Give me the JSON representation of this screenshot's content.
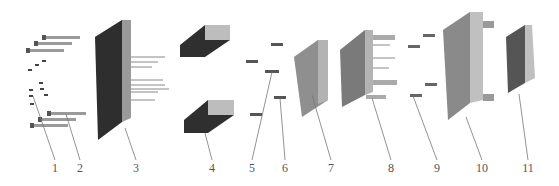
{
  "diagram": {
    "type": "exploded-view assembly",
    "background": "#ffffff",
    "colors": {
      "dark_plate": "#2e2e2e",
      "plate_face": "#8c8c8c",
      "plate_edge": "#b9b9b9",
      "plate_top": "#d0d0d0",
      "leader": "#777777",
      "label": "#555555"
    },
    "parts": [
      {
        "id": "1",
        "label": "1",
        "x": 55,
        "name": "small screws"
      },
      {
        "id": "2",
        "label": "2",
        "x": 80,
        "name": "long socket head bolts"
      },
      {
        "id": "3",
        "label": "3",
        "x": 136,
        "name": "dark plate with pins"
      },
      {
        "id": "4",
        "label": "4",
        "x": 212,
        "name": "spacer blocks"
      },
      {
        "id": "5",
        "label": "5",
        "x": 252,
        "name": "screws"
      },
      {
        "id": "6",
        "label": "6",
        "x": 285,
        "name": "screw"
      },
      {
        "id": "7",
        "label": "7",
        "x": 331,
        "name": "plain plate"
      },
      {
        "id": "8",
        "label": "8",
        "x": 391,
        "name": "plate with guide posts"
      },
      {
        "id": "9",
        "label": "9",
        "x": 437,
        "name": "screws"
      },
      {
        "id": "10",
        "label": "10",
        "x": 482,
        "name": "large plate with bushings"
      },
      {
        "id": "11",
        "label": "11",
        "x": 528,
        "name": "insert plate"
      }
    ]
  }
}
